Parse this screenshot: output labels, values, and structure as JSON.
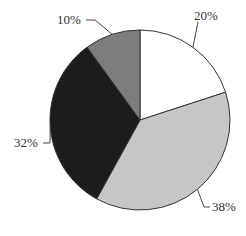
{
  "chart_data": {
    "type": "pie",
    "title": "",
    "categories": [
      "A",
      "B",
      "C",
      "D"
    ],
    "values": [
      20,
      38,
      32,
      10
    ],
    "labels": [
      "20%",
      "38%",
      "32%",
      "10%"
    ],
    "colors": [
      "#ffffff",
      "#c6c6c6",
      "#1c1c1c",
      "#7d7d7d"
    ],
    "start_angle_deg": 90,
    "direction": "clockwise",
    "legend": "none",
    "label_style": "outside with leader lines"
  }
}
